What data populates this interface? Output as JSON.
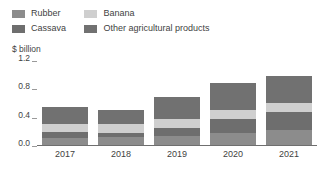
{
  "legend": {
    "items": [
      {
        "label": "Rubber",
        "color": "#8c8c8c",
        "col": 1
      },
      {
        "label": "Cassava",
        "color": "#6e6e6e",
        "col": 1
      },
      {
        "label": "Banana",
        "color": "#cfcfcf",
        "col": 2
      },
      {
        "label": "Other agricultural products",
        "color": "#717171",
        "col": 2
      }
    ]
  },
  "axis": {
    "ylabel": "$ billion",
    "yticks": [
      "1.2",
      "0.8",
      "0.4",
      "0.0"
    ],
    "xticks": [
      "2017",
      "2018",
      "2019",
      "2020",
      "2021"
    ]
  },
  "chart_data": {
    "type": "bar",
    "stacked": true,
    "title": "",
    "subtitle": "",
    "xlabel": "",
    "ylabel": "$ billion",
    "ylim": [
      0,
      1.2
    ],
    "yticks": [
      0.0,
      0.4,
      0.8,
      1.2
    ],
    "grid": false,
    "legend_position": "top-left",
    "categories": [
      "2017",
      "2018",
      "2019",
      "2020",
      "2021"
    ],
    "series": [
      {
        "name": "Rubber",
        "color": "#8c8c8c",
        "values": [
          0.1,
          0.11,
          0.13,
          0.17,
          0.21
        ]
      },
      {
        "name": "Cassava",
        "color": "#6e6e6e",
        "values": [
          0.08,
          0.06,
          0.11,
          0.19,
          0.25
        ]
      },
      {
        "name": "Banana",
        "color": "#cfcfcf",
        "values": [
          0.12,
          0.12,
          0.13,
          0.13,
          0.13
        ]
      },
      {
        "name": "Other agricultural products",
        "color": "#717171",
        "values": [
          0.23,
          0.2,
          0.31,
          0.38,
          0.38
        ]
      }
    ],
    "totals": [
      0.53,
      0.49,
      0.68,
      0.87,
      0.97
    ]
  }
}
